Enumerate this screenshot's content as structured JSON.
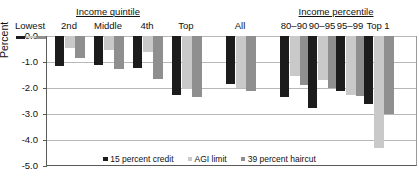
{
  "chart_data": {
    "type": "bar",
    "title": "",
    "xlabel": "",
    "ylabel": "Percent",
    "ylim": [
      -5.0,
      0.0
    ],
    "yticks": [
      "0.0",
      "-1.0",
      "-2.0",
      "-3.0",
      "-4.0",
      "-5.0"
    ],
    "ytick_values": [
      0.0,
      -1.0,
      -2.0,
      -3.0,
      -4.0,
      -5.0
    ],
    "grid": true,
    "legend_position": "bottom",
    "orientation": "vertical",
    "group_headers": [
      {
        "label": "Income quintile",
        "underlined": true
      },
      {
        "label": "Income percentile",
        "underlined": true
      }
    ],
    "categories": [
      "Lowest",
      "2nd",
      "Middle",
      "4th",
      "Top",
      "All",
      "80–90",
      "90–95",
      "95–99",
      "Top 1"
    ],
    "series": [
      {
        "name": "15 percent credit",
        "color": "#1c1c1c",
        "values": [
          -0.12,
          -1.15,
          -1.12,
          -1.22,
          -2.25,
          -1.85,
          -2.35,
          -2.75,
          -2.1,
          -2.6
        ]
      },
      {
        "name": "AGI limit",
        "color": "#c9c9c9",
        "values": [
          -0.08,
          -0.45,
          -0.55,
          -0.62,
          -2.05,
          -2.0,
          -1.55,
          -1.7,
          -2.25,
          -4.3
        ]
      },
      {
        "name": "39 percent haircut",
        "color": "#8f8f8f",
        "values": [
          -0.1,
          -0.85,
          -1.25,
          -1.65,
          -2.35,
          -2.1,
          -1.9,
          -2.0,
          -2.3,
          -3.0
        ]
      }
    ]
  },
  "legend": {
    "items": [
      {
        "label": "15 percent credit",
        "color": "#1c1c1c"
      },
      {
        "label": "AGI limit",
        "color": "#c9c9c9"
      },
      {
        "label": "39 percent haircut",
        "color": "#8f8f8f"
      }
    ]
  }
}
